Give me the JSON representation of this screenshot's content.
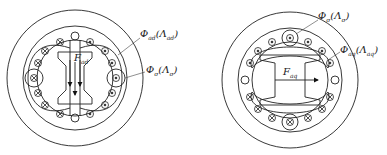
{
  "left": {
    "flux_main": {
      "sym": "Φ",
      "sub": "ad",
      "perm": "Λ",
      "perm_sub": "ad"
    },
    "flux_leak": {
      "sym": "Φ",
      "sub": "σ",
      "perm": "Λ",
      "perm_sub": "σ"
    },
    "mmf": {
      "sym": "F",
      "sub": "ad"
    }
  },
  "right": {
    "flux_leak": {
      "sym": "Φ",
      "sub": "σ",
      "perm": "Λ",
      "perm_sub": "σ"
    },
    "flux_main": {
      "sym": "Φ",
      "sub": "aq",
      "perm": "Λ",
      "perm_sub": "aq"
    },
    "mmf": {
      "sym": "F",
      "sub": "aq"
    }
  }
}
